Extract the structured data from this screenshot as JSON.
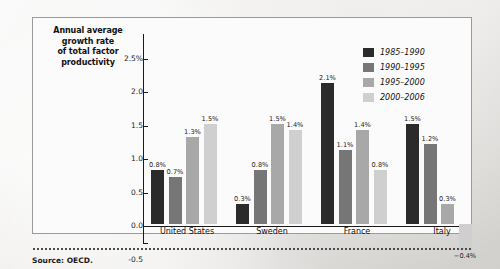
{
  "figure": {
    "axis_title_lines": [
      "Annual average",
      "growth rate",
      "of total factor",
      "productivity"
    ],
    "source_text": "Source: OECD."
  },
  "chart_data": {
    "type": "bar",
    "title": "Annual average growth rate of total factor productivity",
    "xlabel": "",
    "ylabel": "Annual average growth rate of total factor productivity",
    "ylim": [
      -0.5,
      2.75
    ],
    "grid": false,
    "legend_position": "top-right",
    "ytick_labels": [
      "2.5%",
      "2.0",
      "1.5",
      "1.0",
      "0.5",
      "0.0",
      "-0.5"
    ],
    "ytick_values": [
      2.5,
      2.0,
      1.5,
      1.0,
      0.5,
      0.0,
      -0.5
    ],
    "categories": [
      "United States",
      "Sweden",
      "France",
      "Italy"
    ],
    "series": [
      {
        "name": "1985–1990",
        "color": "#2b2b2b",
        "values": [
          0.8,
          0.3,
          2.1,
          1.5
        ],
        "labels": [
          "0.8%",
          "0.3%",
          "2.1%",
          "1.5%"
        ]
      },
      {
        "name": "1990–1995",
        "color": "#767676",
        "values": [
          0.7,
          0.8,
          1.1,
          1.2
        ],
        "labels": [
          "0.7%",
          "0.8%",
          "1.1%",
          "1.2%"
        ]
      },
      {
        "name": "1995–2000",
        "color": "#a8a8a8",
        "values": [
          1.3,
          1.5,
          1.4,
          0.3
        ],
        "labels": [
          "1.3%",
          "1.5%",
          "1.4%",
          "0.3%"
        ]
      },
      {
        "name": "2000–2006",
        "color": "#cfcfcf",
        "values": [
          1.5,
          1.4,
          0.8,
          -0.4
        ],
        "labels": [
          "1.5%",
          "1.4%",
          "0.8%",
          "−0.4%"
        ]
      }
    ]
  }
}
